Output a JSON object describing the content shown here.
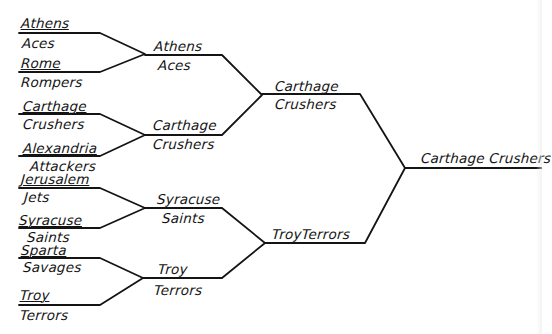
{
  "colors": {
    "ink": "#141414",
    "paper": "#ffffff"
  },
  "round1": [
    {
      "line1": "Athens",
      "line2": "Aces"
    },
    {
      "line1": "Rome",
      "line2": "Rompers"
    },
    {
      "line1": "Carthage",
      "line2": "Crushers"
    },
    {
      "line1": "Alexandria",
      "line2": "Attackers"
    },
    {
      "line1": "Jerusalem",
      "line2": "Jets"
    },
    {
      "line1": "Syracuse",
      "line2": "Saints"
    },
    {
      "line1": "Sparta",
      "line2": "Savages"
    },
    {
      "line1": "Troy",
      "line2": "Terrors"
    }
  ],
  "round2": [
    {
      "line1": "Athens",
      "line2": "Aces"
    },
    {
      "line1": "Carthage",
      "line2": "Crushers"
    },
    {
      "line1": "Syracuse",
      "line2": "Saints"
    },
    {
      "line1": "Troy",
      "line2": "Terrors"
    }
  ],
  "round3": [
    {
      "line1": "Carthage",
      "line2": "Crushers"
    },
    {
      "line1": "TroyTerrors"
    }
  ],
  "champion": {
    "label": "Carthage Crushers"
  }
}
